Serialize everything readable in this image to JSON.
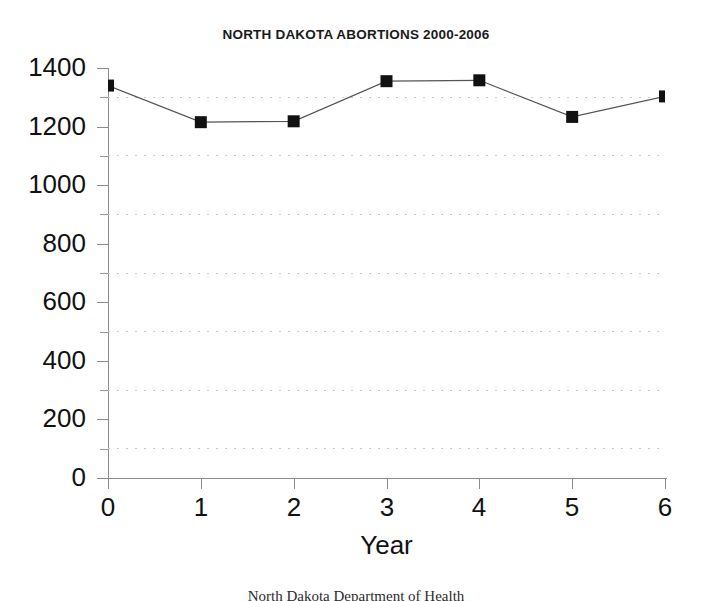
{
  "chart_data": {
    "type": "line",
    "title": "NORTH DAKOTA ABORTIONS 2000-2006",
    "xlabel": "Year",
    "ylabel": "",
    "x": [
      0,
      1,
      2,
      3,
      4,
      5,
      6
    ],
    "values": [
      1340,
      1215,
      1218,
      1355,
      1358,
      1233,
      1303
    ],
    "categories": [
      "0",
      "1",
      "2",
      "3",
      "4",
      "5",
      "6"
    ],
    "xtick_labels": [
      "0",
      "1",
      "2",
      "3",
      "4",
      "5",
      "6"
    ],
    "ytick_labels": [
      "1400",
      "1200",
      "1000",
      "800",
      "600",
      "400",
      "200",
      "0"
    ],
    "ytick_values": [
      1400,
      1200,
      1000,
      800,
      600,
      400,
      200,
      0
    ],
    "minor_gridline_values": [
      1300,
      1100,
      900,
      700,
      500,
      300,
      100
    ],
    "xlim": [
      0,
      6
    ],
    "ylim": [
      0,
      1400
    ],
    "grid": "horizontal-dotted-minor",
    "legend": "none",
    "marker": "filled-square",
    "marker_color": "#111111",
    "line_color": "#555555",
    "gridline_color": "#c9c9c9",
    "axis_color": "#8c8c8c",
    "background_color": "#ffffff"
  },
  "footer": {
    "source_note": "North Dakota Department of Health"
  }
}
